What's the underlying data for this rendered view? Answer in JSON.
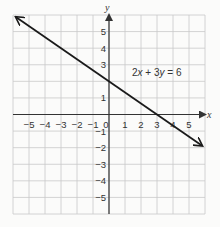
{
  "chart_data": {
    "type": "line",
    "title": "",
    "xlabel": "x",
    "ylabel": "y",
    "xlim": [
      -6,
      6
    ],
    "ylim": [
      -6,
      6
    ],
    "grid": true,
    "x_ticks": [
      -5,
      -4,
      -3,
      -2,
      -1,
      0,
      1,
      2,
      3,
      4,
      5
    ],
    "y_ticks": [
      5,
      4,
      3,
      1,
      -1,
      -2,
      -3,
      -4,
      -5
    ],
    "x_tick_labels": [
      "−5",
      "−4",
      "−3",
      "−2",
      "−1",
      "0",
      "1",
      "2",
      "3",
      "4",
      "5"
    ],
    "y_tick_labels": [
      "5",
      "4",
      "3",
      "1",
      "−1",
      "−2",
      "−3",
      "−4",
      "−5"
    ],
    "series": [
      {
        "name": "2x + 3y = 6",
        "equation": "2x + 3y = 6",
        "slope": -0.6667,
        "y_intercept": 2,
        "x_intercept": 3,
        "points": [
          [
            -5.8,
            5.87
          ],
          [
            0,
            2
          ],
          [
            3,
            0
          ],
          [
            5.8,
            -1.87
          ]
        ],
        "arrows_both_ends": true
      }
    ],
    "annotations": [
      {
        "text": "2x + 3y = 6",
        "x": 1.5,
        "y": 2.5
      }
    ]
  },
  "labels": {
    "x_axis": "x",
    "y_axis": "y",
    "equation_parts": [
      "2",
      "x",
      " + 3",
      "y",
      " = 6"
    ]
  },
  "colors": {
    "grid": "#c9c9c9",
    "axis": "#333333",
    "line": "#1a1a1a",
    "background": "#fbfbfa"
  }
}
